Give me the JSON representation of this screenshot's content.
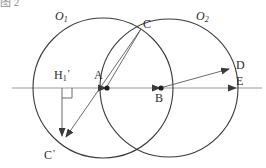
{
  "figure": {
    "type": "geometry-diagram",
    "width": 266,
    "height": 168,
    "background": "#ffffff",
    "stroke_color": "#3a3a3a",
    "axis_color": "#9a9a9a",
    "label_color": "#2b2b2b"
  },
  "top_partial_text": {
    "fragment": "图 2",
    "visible": "clipped"
  },
  "circles": [
    {
      "name": "circle-o1",
      "label": "O",
      "subscript": "1",
      "center_x": 103,
      "center_y": 88,
      "radius": 70,
      "label_x": 55,
      "label_y": 10
    },
    {
      "name": "circle-o2",
      "label": "O",
      "subscript": "2",
      "center_x": 169,
      "center_y": 88,
      "radius": 69,
      "label_x": 196,
      "label_y": 10
    }
  ],
  "points": [
    {
      "name": "point-a",
      "label": "A",
      "subscript": "",
      "prime": "",
      "x": 106,
      "y": 88,
      "label_x": 94,
      "label_y": 69,
      "dot": true
    },
    {
      "name": "point-b",
      "label": "B",
      "subscript": "",
      "prime": "",
      "x": 160,
      "y": 88,
      "label_x": 155,
      "label_y": 92,
      "dot": true
    },
    {
      "name": "point-c",
      "label": "C",
      "subscript": "",
      "prime": "",
      "x": 140,
      "y": 30,
      "label_x": 143,
      "label_y": 18,
      "dot": false
    },
    {
      "name": "point-c-prime",
      "label": "C",
      "subscript": "",
      "prime": "'",
      "x": 62,
      "y": 142,
      "label_x": 44,
      "label_y": 148,
      "dot": false
    },
    {
      "name": "point-d",
      "label": "D",
      "subscript": "",
      "prime": "",
      "x": 232,
      "y": 68,
      "label_x": 236,
      "label_y": 59,
      "dot": false
    },
    {
      "name": "point-e",
      "label": "E",
      "subscript": "",
      "prime": "",
      "x": 236,
      "y": 88,
      "label_x": 236,
      "label_y": 75,
      "dot": false
    },
    {
      "name": "point-h1-prime",
      "label": "H",
      "subscript": "1",
      "prime": "'",
      "x": 62,
      "y": 88,
      "label_x": 54,
      "label_y": 68,
      "dot": false
    }
  ],
  "segments": [
    {
      "name": "axis-line",
      "from": "left-edge",
      "to": "right-edge",
      "x1": 12,
      "y1": 88,
      "x2": 262,
      "y2": 88,
      "arrow": "none"
    },
    {
      "name": "segment-a-to-c",
      "from": "A",
      "to": "C",
      "x1": 106,
      "y1": 88,
      "x2": 140,
      "y2": 30,
      "arrow": "none"
    },
    {
      "name": "segment-c-to-cprime",
      "from": "C",
      "to": "C'",
      "x1": 140,
      "y1": 30,
      "x2": 62,
      "y2": 142,
      "arrow": "end"
    },
    {
      "name": "segment-h1-to-cprime",
      "from": "H1'",
      "to": "C'",
      "x1": 62,
      "y1": 88,
      "x2": 62,
      "y2": 142,
      "arrow": "end"
    },
    {
      "name": "segment-b-to-d",
      "from": "B",
      "to": "D",
      "x1": 160,
      "y1": 88,
      "x2": 232,
      "y2": 68,
      "arrow": "end"
    }
  ],
  "arrowheads": [
    {
      "name": "arrowhead-at-a",
      "x": 106,
      "y": 88,
      "direction": "right"
    },
    {
      "name": "arrowhead-at-b",
      "x": 160,
      "y": 88,
      "direction": "right"
    },
    {
      "name": "arrowhead-at-e",
      "x": 236,
      "y": 88,
      "direction": "right"
    }
  ],
  "right_angle_mark": {
    "name": "right-angle-mark-h1",
    "vertex_x": 62,
    "vertex_y": 88,
    "size": 10,
    "description": "perpendicular mark at H1' between axis and vertical segment"
  }
}
